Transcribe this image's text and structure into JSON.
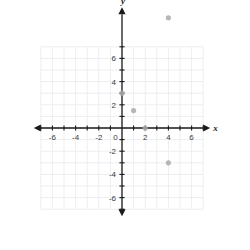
{
  "chart_data": {
    "type": "scatter",
    "title": "",
    "xlabel": "x",
    "ylabel": "y",
    "xlim": [
      -7.6,
      7.6
    ],
    "ylim": [
      -7.6,
      10.4
    ],
    "grid": true,
    "grid_xlim": [
      -7,
      7
    ],
    "grid_ylim": [
      -7,
      7
    ],
    "legend": "none",
    "x_ticks": [
      -6,
      -4,
      -2,
      0,
      2,
      4,
      6
    ],
    "y_ticks": [
      -6,
      -4,
      -2,
      2,
      4,
      6
    ],
    "x_tick_labels": [
      "-6",
      "-4",
      "-2",
      "0",
      "2",
      "4",
      "6"
    ],
    "y_tick_labels": [
      "-6",
      "-4",
      "-2",
      "2",
      "4",
      "6"
    ],
    "origin_label": "0",
    "points": [
      {
        "x": 4,
        "y": 9.5
      },
      {
        "x": 0,
        "y": 3
      },
      {
        "x": 1,
        "y": 1.5
      },
      {
        "x": 2,
        "y": 0
      },
      {
        "x": 4,
        "y": -3
      }
    ]
  },
  "style": {
    "point_color": "#aaaaaa",
    "axis_color": "#1a1a1a",
    "grid_color": "#eceef1",
    "background": "#ffffff"
  }
}
